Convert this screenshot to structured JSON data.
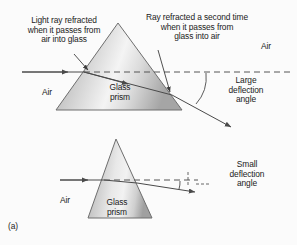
{
  "figure": {
    "part_label": "(a)",
    "caption_alt": "Refraction of light through glass prisms",
    "colors": {
      "ink": "#1a1a1a",
      "ray": "#4a4a4a",
      "dashed": "#555555",
      "prism_edge": "#6e6e6e",
      "prism_light": "#f2f2f2",
      "prism_dark": "#9a9a9a",
      "background": "#fbfbfb"
    }
  },
  "top_panel": {
    "label_light_ray_in": "Light ray refracted\nwhen it passes from\nair into glass",
    "label_ray_second": "Ray refracted a second time\nwhen it passes from\nglass into air",
    "label_air_right": "Air",
    "label_air_left": "Air",
    "label_prism": "Glass\nprism",
    "label_deflection": "Large\ndeflection\nangle"
  },
  "bottom_panel": {
    "label_air_left": "Air",
    "label_prism": "Glass\nprism",
    "label_deflection": "Small\ndeflection\nangle"
  }
}
